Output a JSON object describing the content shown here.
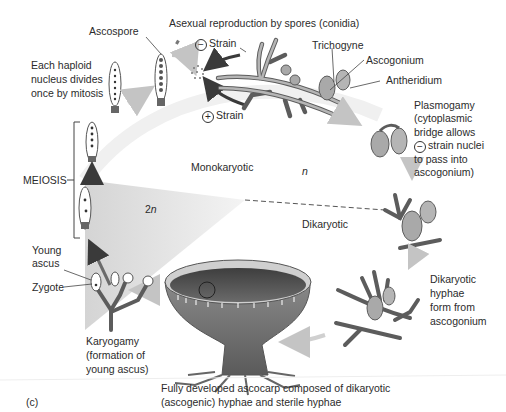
{
  "figure": {
    "panel_label": "(c)",
    "caption": "Fully developed ascocarp composed of dikaryotic\n(ascogenic) hyphae and sterile hyphae"
  },
  "labels": {
    "ascospore": "Ascospore",
    "asexual": "Asexual reproduction by spores (conidia)",
    "minus_strain_symbol": "−",
    "minus_strain": "Strain",
    "plus_strain_symbol": "+",
    "plus_strain": "Strain",
    "trichogyne": "Trichogyne",
    "ascogonium": "Ascogonium",
    "antheridium": "Antheridium",
    "haploid_divides": "Each haploid\nnucleus divides\nonce by mitosis",
    "plasmogamy_1": "Plasmogamy",
    "plasmogamy_2": "(cytoplasmic",
    "plasmogamy_3": "bridge allows",
    "plasmogamy_symbol": "−",
    "plasmogamy_4": "strain nuclei",
    "plasmogamy_5": "to pass into",
    "plasmogamy_6": "ascogonium)",
    "meiosis": "MEIOSIS",
    "monokaryotic": "Monokaryotic",
    "haploid_n": "n",
    "diploid_2": "2",
    "diploid_n": "n",
    "dikaryotic": "Dikaryotic",
    "dikaryotic_hyphae": "Dikaryotic\nhyphae\nform from\nascogonium",
    "young_ascus": "Young\nascus",
    "zygote": "Zygote",
    "karyogamy": "Karyogamy\n(formation of\nyoung ascus)"
  },
  "colors": {
    "hypha_fill": "#a9a9a9",
    "hypha_stroke": "#5c5c5c",
    "arrow_dark": "#3a3a3a",
    "arrow_light": "#c8c8c8",
    "diploid_wedge": "#dcdcdc",
    "cup_dark": "#4a4a4a"
  }
}
